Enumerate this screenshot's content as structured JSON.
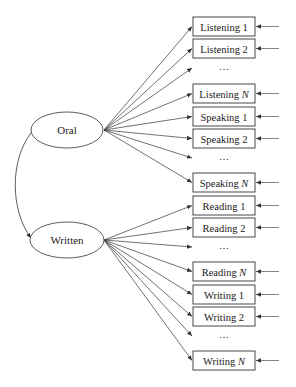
{
  "diagram": {
    "type": "path-diagram",
    "colors": {
      "line": "#333333",
      "text": "#222222",
      "background": "#ffffff"
    },
    "factors": [
      {
        "id": "oral",
        "label": "Oral",
        "cx": 67,
        "cy": 130,
        "rx": 36,
        "ry": 18,
        "origin": [
          104,
          130
        ]
      },
      {
        "id": "written",
        "label": "Written",
        "cx": 67,
        "cy": 240,
        "rx": 37,
        "ry": 18,
        "origin": [
          104,
          240
        ]
      }
    ],
    "covariance": {
      "from": "oral",
      "to": "written",
      "path": "M31,133 C10,160 10,210 31,238"
    },
    "indicators": [
      {
        "label": "Listening 1",
        "italic_suffix": "",
        "factor": "oral",
        "y": 17,
        "type": "box"
      },
      {
        "label": "Listening 2",
        "italic_suffix": "",
        "factor": "oral",
        "y": 39,
        "type": "box"
      },
      {
        "label": "…",
        "factor": "oral",
        "y": 64,
        "type": "ellipsis"
      },
      {
        "label": "Listening ",
        "italic_suffix": "N",
        "factor": "oral",
        "y": 84,
        "type": "box"
      },
      {
        "label": "Speaking 1",
        "italic_suffix": "",
        "factor": "oral",
        "y": 107,
        "type": "box"
      },
      {
        "label": "Speaking 2",
        "italic_suffix": "",
        "factor": "oral",
        "y": 129,
        "type": "box"
      },
      {
        "label": "…",
        "factor": "oral",
        "y": 154,
        "type": "ellipsis"
      },
      {
        "label": "Speaking ",
        "italic_suffix": "N",
        "factor": "oral",
        "y": 173,
        "type": "box"
      },
      {
        "label": "Reading 1",
        "italic_suffix": "",
        "factor": "written",
        "y": 196,
        "type": "box"
      },
      {
        "label": "Reading 2",
        "italic_suffix": "",
        "factor": "written",
        "y": 218,
        "type": "box"
      },
      {
        "label": "…",
        "factor": "written",
        "y": 243,
        "type": "ellipsis"
      },
      {
        "label": "Reading ",
        "italic_suffix": "N",
        "factor": "written",
        "y": 262,
        "type": "box"
      },
      {
        "label": "Writing 1",
        "italic_suffix": "",
        "factor": "written",
        "y": 285,
        "type": "box"
      },
      {
        "label": "Writing 2",
        "italic_suffix": "",
        "factor": "written",
        "y": 307,
        "type": "box"
      },
      {
        "label": "…",
        "factor": "written",
        "y": 332,
        "type": "ellipsis"
      },
      {
        "label": "Writing ",
        "italic_suffix": "N",
        "factor": "written",
        "y": 351,
        "type": "box"
      }
    ],
    "box": {
      "x": 193,
      "width": 62,
      "height": 19
    },
    "error_line": {
      "x1": 279,
      "x2": 256
    }
  }
}
